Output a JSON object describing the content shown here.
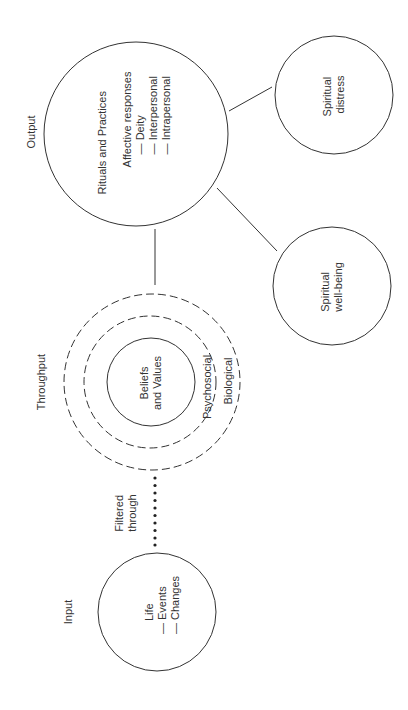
{
  "stages": {
    "input": "Input",
    "throughput": "Throughput",
    "output": "Output"
  },
  "input_circle": {
    "line1": "Life",
    "line2": "— Events",
    "line3": "— Changes"
  },
  "connector_label": {
    "line1": "Filtered",
    "line2": "through"
  },
  "throughput_circles": {
    "inner_line1": "Beliefs",
    "inner_line2": "and Values",
    "middle": "Psychosocial",
    "outer": "Biological"
  },
  "output_circle": {
    "title": "Rituals and Practices",
    "subtitle": "Affective responses",
    "items": [
      "— Deity",
      "— Interpersonal",
      "— Intrapersonal"
    ]
  },
  "outcomes": {
    "well_being_line1": "Spiritual",
    "well_being_line2": "well-being",
    "distress_line1": "Spiritual",
    "distress_line2": "distress"
  },
  "colors": {
    "stroke": "#333333",
    "background": "#ffffff"
  }
}
